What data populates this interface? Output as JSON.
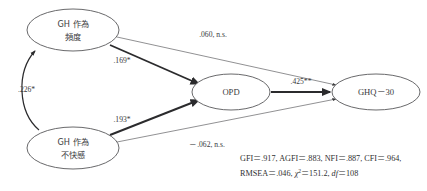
{
  "diagram": {
    "type": "path-diagram",
    "title": "",
    "nodes": [
      {
        "id": "gh_frequency",
        "label_line1": "GH 作為",
        "label_line2": "頻度",
        "shape": "ellipse",
        "cx": 73,
        "cy": 30,
        "rx": 46,
        "ry": 21
      },
      {
        "id": "gh_displeasure",
        "label_line1": "GH 作為",
        "label_line2": "不快感",
        "shape": "ellipse",
        "cx": 73,
        "cy": 148,
        "rx": 46,
        "ry": 21
      },
      {
        "id": "opd",
        "label_line1": "OPD",
        "label_line2": "",
        "shape": "ellipse",
        "cx": 231,
        "cy": 92,
        "rx": 39,
        "ry": 18
      },
      {
        "id": "ghq30",
        "label_line1": "GHQ－30",
        "label_line2": "",
        "shape": "ellipse",
        "cx": 376,
        "cy": 92,
        "rx": 44,
        "ry": 18
      }
    ],
    "edges": [
      {
        "id": "freq_to_ghq",
        "from": "gh_frequency",
        "to": "ghq30",
        "label": ".060, n.s.",
        "significance": "n.s.",
        "weight": "thin"
      },
      {
        "id": "freq_to_opd",
        "from": "gh_frequency",
        "to": "opd",
        "label": ".169*",
        "significance": "*",
        "weight": "thick"
      },
      {
        "id": "displeasure_to_opd",
        "from": "gh_displeasure",
        "to": "opd",
        "label": ".193*",
        "significance": "*",
        "weight": "thick"
      },
      {
        "id": "displeasure_to_ghq",
        "from": "gh_displeasure",
        "to": "ghq30",
        "label": "－.062, n.s.",
        "significance": "n.s.",
        "weight": "thin"
      },
      {
        "id": "opd_to_ghq",
        "from": "opd",
        "to": "ghq30",
        "label": ".425**",
        "significance": "**",
        "weight": "thick"
      },
      {
        "id": "freq_corr_displeasure",
        "from": "gh_displeasure",
        "to": "gh_frequency",
        "label": ".226*",
        "significance": "*",
        "weight": "curve"
      }
    ],
    "fit_statistics": {
      "line1": "GFI＝.917, AGFI＝.883, NFI＝.887, CFI＝.964,",
      "line2_prefix": "RMSEA＝.046, ",
      "line2_chi": "χ",
      "line2_chi_sup": "2",
      "line2_chi_value": "＝151.2, ",
      "line2_df": "df",
      "line2_df_value": "＝108"
    },
    "colors": {
      "node_stroke": "#58585a",
      "text": "#3a3a3c",
      "path_strong": "#2b2b2d",
      "path_weak": "#7d7d80",
      "background": "#ffffff"
    }
  }
}
